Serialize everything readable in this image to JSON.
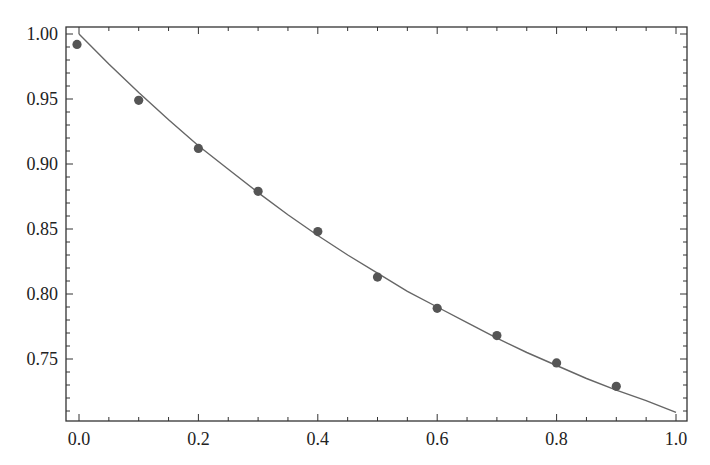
{
  "chart_data": {
    "type": "scatter",
    "title": "",
    "xlabel": "",
    "ylabel": "",
    "xlim": [
      -0.02,
      1.02
    ],
    "ylim": [
      0.705,
      1.005
    ],
    "grid": false,
    "legend": null,
    "x_ticks": [
      0.0,
      0.2,
      0.4,
      0.6,
      0.8,
      1.0
    ],
    "x_tick_labels": [
      "0.0",
      "0.2",
      "0.4",
      "0.6",
      "0.8",
      "1.0"
    ],
    "y_ticks": [
      0.75,
      0.8,
      0.85,
      0.9,
      0.95,
      1.0
    ],
    "y_tick_labels": [
      "0.75",
      "0.80",
      "0.85",
      "0.90",
      "0.95",
      "1.00"
    ],
    "series": [
      {
        "name": "data points",
        "type": "scatter",
        "color": "#555555",
        "x": [
          0.0,
          0.1,
          0.2,
          0.3,
          0.4,
          0.5,
          0.6,
          0.7,
          0.8,
          0.9
        ],
        "y": [
          0.992,
          0.949,
          0.912,
          0.879,
          0.848,
          0.813,
          0.789,
          0.768,
          0.747,
          0.729
        ]
      },
      {
        "name": "fit curve",
        "type": "line",
        "color": "#666666",
        "x": [
          0.0,
          0.05,
          0.1,
          0.15,
          0.2,
          0.25,
          0.3,
          0.35,
          0.4,
          0.45,
          0.5,
          0.55,
          0.6,
          0.65,
          0.7,
          0.75,
          0.8,
          0.85,
          0.9,
          0.95,
          1.0
        ],
        "y": [
          1.0,
          0.977,
          0.955,
          0.934,
          0.914,
          0.896,
          0.878,
          0.861,
          0.845,
          0.83,
          0.816,
          0.802,
          0.79,
          0.778,
          0.766,
          0.755,
          0.745,
          0.735,
          0.726,
          0.718,
          0.709
        ]
      }
    ]
  },
  "layout": {
    "frame": {
      "left": 66,
      "top": 27,
      "right": 687,
      "bottom": 421
    },
    "x_map": {
      "x0": 79,
      "scale": 597
    },
    "y_map": {
      "y1": 34,
      "scale": 1300
    }
  }
}
